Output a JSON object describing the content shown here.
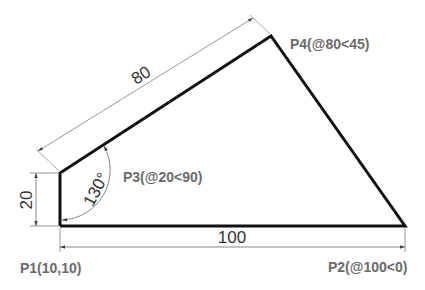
{
  "diagram": {
    "type": "cad-polyline-drawing",
    "points": [
      {
        "id": "P1",
        "label": "P1(10,10)",
        "x": 60,
        "y": 226
      },
      {
        "id": "P2",
        "label": "P2(@100<0)",
        "x": 405,
        "y": 226
      },
      {
        "id": "P3",
        "label": "P3(@20<90)",
        "x": 60,
        "y": 173
      },
      {
        "id": "P4",
        "label": "P4(@80<45)",
        "x": 271,
        "y": 36
      }
    ],
    "dimensions": {
      "bottom": "100",
      "left": "20",
      "slant": "80",
      "angle": "130°"
    },
    "colors": {
      "outline": "#111111",
      "dimension_line": "#9a9a9a",
      "label": "#6b6b6b",
      "dimension_text": "#333333"
    }
  }
}
